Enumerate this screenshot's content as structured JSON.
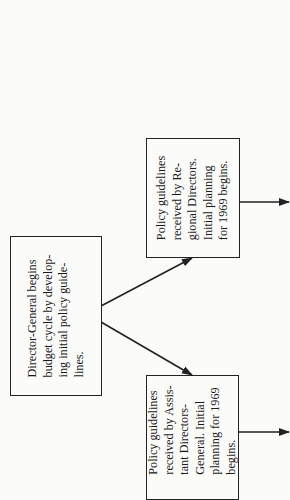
{
  "diagram": {
    "orientation": "rotated-90-ccw",
    "nodes": [
      {
        "id": "director-general",
        "lines": [
          "Director-General begins",
          "budget cycle by develop-",
          "ing initial policy guide-",
          "lines."
        ]
      },
      {
        "id": "regional-directors",
        "lines": [
          "Policy guidelines",
          "received by Re-",
          "gional Directors.",
          "Initial planning",
          "for 1969 begins."
        ]
      },
      {
        "id": "assistant-directors-general",
        "lines": [
          "Policy guidelines",
          "received by Assis-",
          "tant Directors-",
          "General. Initial",
          "planning for 1969",
          "begins."
        ]
      }
    ],
    "edges": [
      {
        "from": "director-general",
        "to": "regional-directors"
      },
      {
        "from": "director-general",
        "to": "assistant-directors-general"
      },
      {
        "from": "regional-directors",
        "to": "offscreen-right"
      },
      {
        "from": "assistant-directors-general",
        "to": "offscreen-right"
      }
    ],
    "colors": {
      "line": "#222222",
      "background": "#fbfbf9"
    }
  }
}
